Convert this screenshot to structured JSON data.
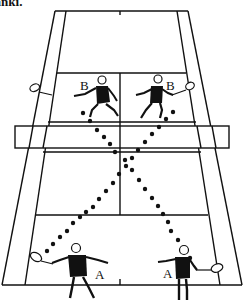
{
  "caption": "lanki.",
  "diagram": {
    "type": "badminton-doubles-court-perspective",
    "colors": {
      "line": "#111111",
      "background": "#ffffff",
      "player": "#111111"
    },
    "players": [
      {
        "id": "B-left",
        "label": "B",
        "side": "far",
        "position": "left service court"
      },
      {
        "id": "B-right",
        "label": "B",
        "side": "far",
        "position": "right service court"
      },
      {
        "id": "A-left",
        "label": "A",
        "side": "near",
        "position": "left back court"
      },
      {
        "id": "A-right",
        "label": "A",
        "side": "near",
        "position": "right back court"
      }
    ],
    "trajectories": [
      {
        "from": "B-left",
        "to": "A-right",
        "style": "dotted"
      },
      {
        "from": "B-right",
        "to": "A-left",
        "style": "dotted"
      }
    ],
    "labels": {
      "b_left": "B",
      "b_right": "B",
      "a_left": "A",
      "a_right": "A"
    }
  }
}
